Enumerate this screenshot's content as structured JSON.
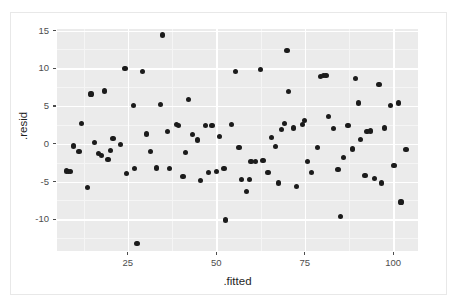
{
  "chart_data": {
    "type": "scatter",
    "title": "",
    "xlabel": ".fitted",
    "ylabel": ".resid",
    "xlim": [
      5,
      107
    ],
    "ylim": [
      -14.2,
      15.2
    ],
    "xticks": [
      25,
      50,
      75,
      100
    ],
    "yticks": [
      15,
      10,
      5,
      0,
      -5,
      -10
    ],
    "xtick_labels": [
      "25",
      "50",
      "75",
      "100"
    ],
    "ytick_labels": [
      "15",
      "10",
      "5",
      "0",
      "-5",
      "-10"
    ],
    "grid": "white major and minor gridlines on grey panel",
    "legend": "none",
    "point_color": "#1b1b1b",
    "panel_color": "#ebebeb",
    "gridline_color": "#ffffff",
    "points": [
      [
        7.6,
        -3.6
      ],
      [
        8.2,
        -3.7
      ],
      [
        8.8,
        -3.7
      ],
      [
        9.6,
        -0.3
      ],
      [
        11.2,
        -1.0
      ],
      [
        12.0,
        2.7
      ],
      [
        13.6,
        -5.8
      ],
      [
        14.6,
        6.6
      ],
      [
        15.6,
        0.2
      ],
      [
        16.8,
        -1.3
      ],
      [
        17.6,
        -1.6
      ],
      [
        18.4,
        7.0
      ],
      [
        19.4,
        -2.1
      ],
      [
        20.2,
        -0.9
      ],
      [
        20.8,
        0.7
      ],
      [
        23.0,
        -0.1
      ],
      [
        24.2,
        10.0
      ],
      [
        24.6,
        -3.9
      ],
      [
        26.6,
        5.1
      ],
      [
        27.0,
        -3.3
      ],
      [
        27.6,
        -13.2
      ],
      [
        29.2,
        9.6
      ],
      [
        30.4,
        1.3
      ],
      [
        31.4,
        -1.0
      ],
      [
        33.0,
        -3.2
      ],
      [
        34.2,
        5.2
      ],
      [
        34.8,
        14.4
      ],
      [
        36.2,
        1.6
      ],
      [
        36.8,
        -3.3
      ],
      [
        38.8,
        2.5
      ],
      [
        39.4,
        2.4
      ],
      [
        40.6,
        -4.3
      ],
      [
        41.4,
        -1.2
      ],
      [
        42.2,
        5.9
      ],
      [
        43.4,
        1.2
      ],
      [
        44.6,
        0.5
      ],
      [
        45.6,
        -4.9
      ],
      [
        47.0,
        2.4
      ],
      [
        47.8,
        -3.8
      ],
      [
        48.8,
        2.4
      ],
      [
        50.0,
        -3.7
      ],
      [
        50.8,
        1.0
      ],
      [
        52.2,
        -3.3
      ],
      [
        52.6,
        -10.1
      ],
      [
        54.4,
        2.5
      ],
      [
        55.4,
        9.6
      ],
      [
        56.4,
        -0.5
      ],
      [
        57.2,
        -4.7
      ],
      [
        58.6,
        -6.3
      ],
      [
        59.4,
        -4.7
      ],
      [
        59.8,
        -2.4
      ],
      [
        61.0,
        -2.3
      ],
      [
        62.4,
        9.8
      ],
      [
        63.2,
        -2.2
      ],
      [
        64.6,
        -3.8
      ],
      [
        65.6,
        0.8
      ],
      [
        66.8,
        -0.4
      ],
      [
        67.6,
        -5.2
      ],
      [
        68.4,
        1.9
      ],
      [
        69.2,
        2.7
      ],
      [
        70.0,
        12.3
      ],
      [
        70.4,
        6.9
      ],
      [
        71.8,
        2.1
      ],
      [
        72.6,
        -5.7
      ],
      [
        74.4,
        2.5
      ],
      [
        75.0,
        3.1
      ],
      [
        75.8,
        -2.4
      ],
      [
        77.0,
        -3.8
      ],
      [
        78.6,
        -0.5
      ],
      [
        79.4,
        8.9
      ],
      [
        80.2,
        9.0
      ],
      [
        81.0,
        9.0
      ],
      [
        81.8,
        3.6
      ],
      [
        83.2,
        2.0
      ],
      [
        84.4,
        -3.4
      ],
      [
        85.0,
        -9.6
      ],
      [
        86.0,
        -1.8
      ],
      [
        87.2,
        2.4
      ],
      [
        88.4,
        -0.7
      ],
      [
        89.4,
        8.6
      ],
      [
        90.2,
        5.4
      ],
      [
        90.8,
        0.6
      ],
      [
        92.0,
        -4.2
      ],
      [
        92.6,
        1.6
      ],
      [
        93.6,
        1.7
      ],
      [
        94.8,
        -4.6
      ],
      [
        96.0,
        7.8
      ],
      [
        96.8,
        -5.2
      ],
      [
        97.6,
        2.1
      ],
      [
        99.2,
        5.1
      ],
      [
        100.2,
        -2.9
      ],
      [
        101.4,
        5.4
      ],
      [
        102.2,
        -7.7
      ],
      [
        103.6,
        -0.8
      ]
    ]
  },
  "axes": {
    "x_title": ".fitted",
    "y_title": ".resid"
  }
}
